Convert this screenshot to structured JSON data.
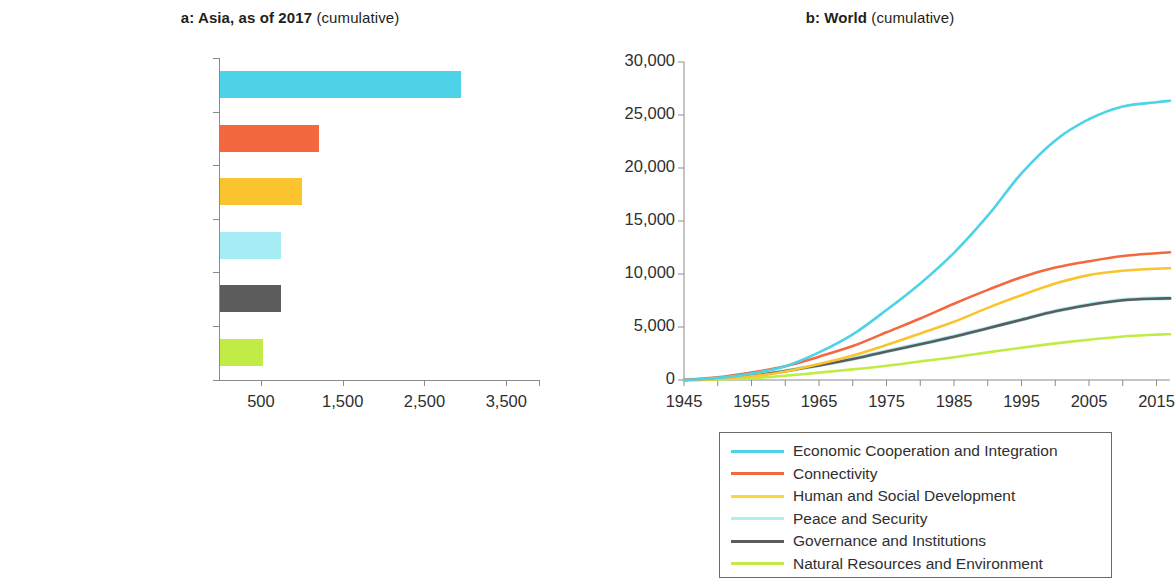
{
  "panel_a": {
    "title_bold": "a: Asia, as of 2017",
    "title_light": "(cumulative)",
    "x_ticks": [
      "500",
      "1,500",
      "2,500",
      "3,500"
    ]
  },
  "panel_b": {
    "title_bold": "b: World",
    "title_light": "(cumulative)",
    "y_ticks": [
      "30,000",
      "25,000",
      "20,000",
      "15,000",
      "10,000",
      "5,000",
      "0"
    ],
    "x_ticks": [
      "1945",
      "1955",
      "1965",
      "1975",
      "1985",
      "1995",
      "2005",
      "2015"
    ]
  },
  "legend": {
    "items": [
      {
        "label": "Economic Cooperation and Integration",
        "color": "#4dd2e8"
      },
      {
        "label": "Connectivity",
        "color": "#f4683f"
      },
      {
        "label": "Human and Social Development",
        "color": "#fbd53a"
      },
      {
        "label": "Peace and Security",
        "color": "#b2ecf5"
      },
      {
        "label": "Governance and Institutions",
        "color": "#5c5c5c"
      },
      {
        "label": "Natural Resources and Environment",
        "color": "#c0ec45"
      }
    ]
  },
  "chart_data": [
    {
      "type": "bar",
      "orientation": "horizontal",
      "title": "a: Asia, as of 2017 (cumulative)",
      "xlabel": "",
      "ylabel": "",
      "xlim": [
        0,
        3900
      ],
      "grid": false,
      "categories": [
        "Economic Cooperation and Integration",
        "Connectivity",
        "Human and Social Development",
        "Peace and Security",
        "Governance and Institutions",
        "Natural Resources and Environment"
      ],
      "values": [
        2950,
        1210,
        1000,
        740,
        740,
        530
      ],
      "colors": [
        "#4dd2e8",
        "#f4683f",
        "#fbc42e",
        "#a5ecf5",
        "#5c5c5c",
        "#c0ec45"
      ],
      "xticks": [
        500,
        1500,
        2500,
        3500
      ]
    },
    {
      "type": "line",
      "title": "b: World (cumulative)",
      "xlabel": "",
      "ylabel": "",
      "xlim": [
        1945,
        2017
      ],
      "ylim": [
        0,
        30000
      ],
      "grid": false,
      "legend_position": "bottom",
      "x": [
        1945,
        1950,
        1955,
        1960,
        1965,
        1970,
        1975,
        1980,
        1985,
        1990,
        1995,
        2000,
        2005,
        2010,
        2015,
        2017
      ],
      "series": [
        {
          "name": "Economic Cooperation and Integration",
          "color": "#4dd2e8",
          "values": [
            0,
            200,
            600,
            1300,
            2600,
            4300,
            6600,
            9100,
            12000,
            15500,
            19500,
            22600,
            24600,
            25800,
            26200,
            26350
          ]
        },
        {
          "name": "Connectivity",
          "color": "#f4683f",
          "values": [
            0,
            250,
            700,
            1300,
            2200,
            3200,
            4500,
            5800,
            7200,
            8500,
            9700,
            10600,
            11200,
            11700,
            11950,
            12050
          ]
        },
        {
          "name": "Human and Social Development",
          "color": "#fbc42e",
          "values": [
            0,
            100,
            350,
            800,
            1500,
            2300,
            3300,
            4400,
            5500,
            6800,
            8000,
            9100,
            9900,
            10300,
            10500,
            10550
          ]
        },
        {
          "name": "Peace and Security",
          "color": "#a5ecf5",
          "values": [
            0,
            120,
            400,
            850,
            1400,
            2000,
            2700,
            3400,
            4100,
            4900,
            5700,
            6500,
            7100,
            7550,
            7700,
            7720
          ]
        },
        {
          "name": "Governance and Institutions",
          "color": "#5c5c5c",
          "values": [
            0,
            110,
            390,
            840,
            1380,
            1980,
            2680,
            3380,
            4080,
            4880,
            5680,
            6480,
            7080,
            7520,
            7680,
            7700
          ]
        },
        {
          "name": "Natural Resources and Environment",
          "color": "#c0ec45",
          "values": [
            0,
            60,
            180,
            400,
            700,
            1000,
            1350,
            1750,
            2150,
            2600,
            3050,
            3450,
            3800,
            4100,
            4280,
            4320
          ]
        }
      ]
    }
  ]
}
